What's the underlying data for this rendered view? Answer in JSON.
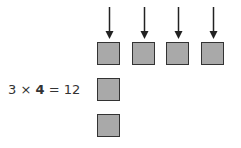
{
  "equation": {
    "a": "3",
    "times": "×",
    "b": "4",
    "equals": "=",
    "result": "12"
  },
  "colors": {
    "square_fill": "#a9a9a9",
    "square_border": "#333333",
    "arrow": "#222222"
  },
  "grid": {
    "columns": 4,
    "rows": 3,
    "top_row_squares": 4,
    "left_column_squares": 3
  }
}
